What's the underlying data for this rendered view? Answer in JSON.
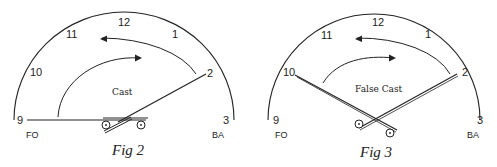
{
  "figures": [
    {
      "caption": "Fig 2",
      "center_label": "Cast",
      "clock_numbers": [
        "9",
        "10",
        "11",
        "12",
        "1",
        "2",
        "3"
      ],
      "left_label": "FO",
      "right_label": "BA",
      "rod_positions": [
        "9",
        "2"
      ]
    },
    {
      "caption": "Fig 3",
      "center_label": "False Cast",
      "clock_numbers": [
        "9",
        "10",
        "11",
        "12",
        "1",
        "2",
        "3"
      ],
      "left_label": "FO",
      "right_label": "BA",
      "rod_positions": [
        "10",
        "2"
      ]
    }
  ],
  "colors": {
    "ink": "#222222",
    "background": "#ffffff"
  }
}
